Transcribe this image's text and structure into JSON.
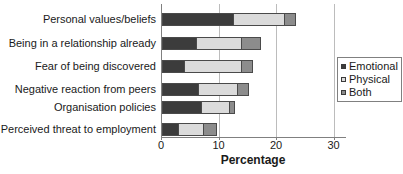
{
  "chart_data": {
    "type": "bar",
    "orientation": "horizontal",
    "stacked": true,
    "title": "",
    "xlabel": "Percentage",
    "ylabel": "",
    "categories": [
      "Personal values/beliefs",
      "Being in a relationship already",
      "Fear of being discovered",
      "Negative reaction from peers",
      "Organisation policies",
      "Perceived threat to employment"
    ],
    "series": [
      {
        "name": "Emotional",
        "color": "#3c3c3c",
        "values": [
          12.5,
          6,
          4,
          6.5,
          7,
          3
        ]
      },
      {
        "name": "Physical",
        "color": "#dbdbdb",
        "values": [
          9,
          8,
          10,
          7,
          5,
          4.5
        ]
      },
      {
        "name": "Both",
        "color": "#8c8c8c",
        "values": [
          2,
          3.5,
          2,
          2,
          1,
          2.5
        ]
      }
    ],
    "totals": [
      23.5,
      17.5,
      16,
      15.5,
      13,
      10
    ],
    "xlim": [
      0,
      30
    ],
    "x_ticks": [
      0,
      10,
      20,
      30
    ],
    "grid": "vertical-gridlines-on",
    "legend_position": "right",
    "colors": {
      "axis": "#808080",
      "gridline": "#bcbcbc",
      "bar_border": "#4a4a4a",
      "text": "#1a1a1a",
      "background": "#ffffff",
      "legend_border": "#808080"
    }
  }
}
